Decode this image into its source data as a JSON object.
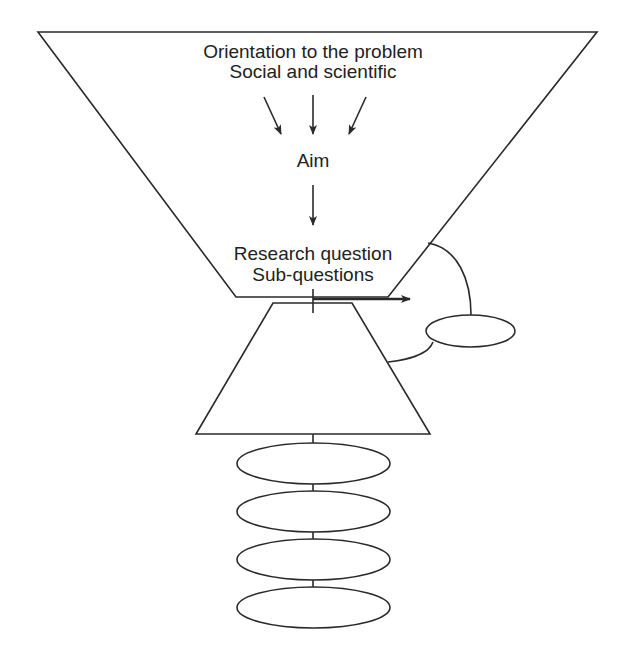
{
  "diagram": {
    "type": "research-design-funnel",
    "colors": {
      "stroke": "#2a2a2a",
      "text": "#222222",
      "background": "#ffffff"
    },
    "upper_funnel": {
      "lines": [
        "Orientation to the problem",
        "Social and scientific",
        "Aim",
        "Research question",
        "Sub-questions"
      ],
      "converging_arrows": 3,
      "downward_arrows": 1
    },
    "side_ellipse": {
      "label": ""
    },
    "lower_trapezoid": {
      "label": ""
    },
    "stacked_ellipses": [
      {
        "label": ""
      },
      {
        "label": ""
      },
      {
        "label": ""
      },
      {
        "label": ""
      }
    ]
  }
}
